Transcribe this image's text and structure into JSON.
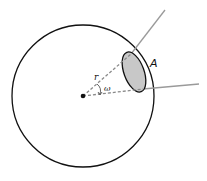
{
  "diagram": {
    "type": "geometry",
    "labels": {
      "radius": "r",
      "angle": "ω",
      "area": "A"
    },
    "colors": {
      "stroke": "#111111",
      "ray": "#9a9a9a",
      "dashed": "#8a8a8a",
      "area_fill": "#c8c8c8",
      "background": "#ffffff"
    }
  }
}
